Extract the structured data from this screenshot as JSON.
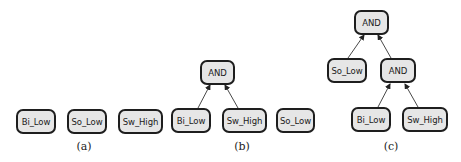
{
  "figure": {
    "panels": [
      {
        "caption": "(a)",
        "nodes": [
          {
            "label": "Bi_Low"
          },
          {
            "label": "So_Low"
          },
          {
            "label": "Sw_High"
          }
        ]
      },
      {
        "caption": "(b)",
        "nodes": [
          {
            "label": "AND"
          },
          {
            "label": "Bi_Low"
          },
          {
            "label": "Sw_High"
          },
          {
            "label": "So_Low"
          }
        ],
        "edges": [
          {
            "from": "Bi_Low",
            "to": "AND"
          },
          {
            "from": "Sw_High",
            "to": "AND"
          }
        ]
      },
      {
        "caption": "(c)",
        "nodes": [
          {
            "label": "AND"
          },
          {
            "label": "So_Low"
          },
          {
            "label": "AND"
          },
          {
            "label": "Bi_Low"
          },
          {
            "label": "Sw_High"
          }
        ],
        "edges": [
          {
            "from": "So_Low",
            "to": "AND (top)"
          },
          {
            "from": "AND (middle)",
            "to": "AND (top)"
          },
          {
            "from": "Bi_Low",
            "to": "AND (middle)"
          },
          {
            "from": "Sw_High",
            "to": "AND (middle)"
          }
        ]
      }
    ],
    "colors": {
      "node_fill": "#e6e6e6",
      "node_border": "#1e1e1e",
      "edge": "#333333"
    }
  }
}
